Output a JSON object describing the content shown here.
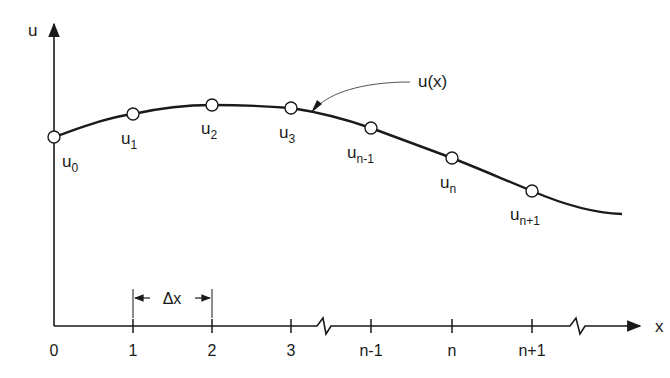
{
  "diagram": {
    "type": "finite-difference grid on curve",
    "colors": {
      "ink": "#1a1a1a",
      "leader": "#555555",
      "background": "#ffffff"
    },
    "axes": {
      "y_label": "u",
      "x_label": "x"
    },
    "curve_label": "u(x)",
    "spacing_label": "Δx",
    "ticks": [
      {
        "label": "0",
        "x": 54
      },
      {
        "label": "1",
        "x": 133
      },
      {
        "label": "2",
        "x": 212
      },
      {
        "label": "3",
        "x": 291
      },
      {
        "label": "n-1",
        "x": 371
      },
      {
        "label": "n",
        "x": 452
      },
      {
        "label": "n+1",
        "x": 532
      }
    ],
    "nodes": [
      {
        "base": "u",
        "sub": "0",
        "x": 54,
        "y": 137
      },
      {
        "base": "u",
        "sub": "1",
        "x": 133,
        "y": 114
      },
      {
        "base": "u",
        "sub": "2",
        "x": 212,
        "y": 105
      },
      {
        "base": "u",
        "sub": "3",
        "x": 291,
        "y": 108
      },
      {
        "base": "u",
        "sub": "n-1",
        "x": 371,
        "y": 128
      },
      {
        "base": "u",
        "sub": "n",
        "x": 452,
        "y": 158
      },
      {
        "base": "u",
        "sub": "n+1",
        "x": 532,
        "y": 191
      }
    ],
    "axis_breaks": [
      {
        "position": "between 3 and n-1"
      },
      {
        "position": "after n+1"
      }
    ]
  }
}
